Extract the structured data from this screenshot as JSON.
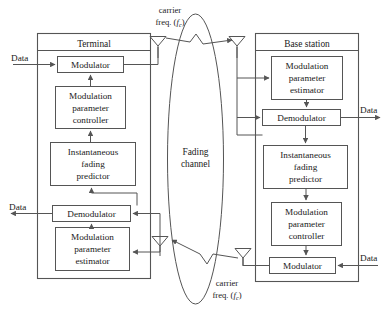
{
  "figure": {
    "caption": ""
  },
  "terminal": {
    "title": "Terminal",
    "blocks": [
      {
        "id": "tx-modulator",
        "label": "Modulator"
      },
      {
        "id": "tx-mod-param-controller",
        "lines": [
          "Modulation",
          "parameter",
          "controller"
        ]
      },
      {
        "id": "tx-fading-predictor",
        "lines": [
          "Instantaneous",
          "fading",
          "predictor"
        ]
      },
      {
        "id": "rx-demodulator",
        "label": "Demodulator"
      },
      {
        "id": "rx-mod-param-estimator",
        "lines": [
          "Modulation",
          "parameter",
          "estimator"
        ]
      }
    ],
    "data_in_label": "Data",
    "data_out_label": "Data"
  },
  "base_station": {
    "title": "Base station",
    "blocks": [
      {
        "id": "bs-mod-param-estimator",
        "lines": [
          "Modulation",
          "parameter",
          "estimator"
        ]
      },
      {
        "id": "bs-demodulator",
        "label": "Demodulator"
      },
      {
        "id": "bs-fading-predictor",
        "lines": [
          "Instantaneous",
          "fading",
          "predictor"
        ]
      },
      {
        "id": "bs-mod-param-controller",
        "lines": [
          "Modulation",
          "parameter",
          "controller"
        ]
      },
      {
        "id": "bs-modulator",
        "label": "Modulator"
      }
    ],
    "data_out_label": "Data",
    "data_in_label": "Data"
  },
  "channel": {
    "lines": [
      "Fading",
      "channel"
    ]
  },
  "carrier": {
    "line1": "carrier",
    "line2_prefix": "freq. (",
    "line2_symbol": "f",
    "line2_sub": "c",
    "line2_suffix": ")"
  },
  "icons": {
    "antenna": "antenna-icon",
    "arrow": "arrow-icon"
  },
  "colors": {
    "stroke": "#555555",
    "text": "#1a1a1a",
    "background": "#ffffff"
  }
}
